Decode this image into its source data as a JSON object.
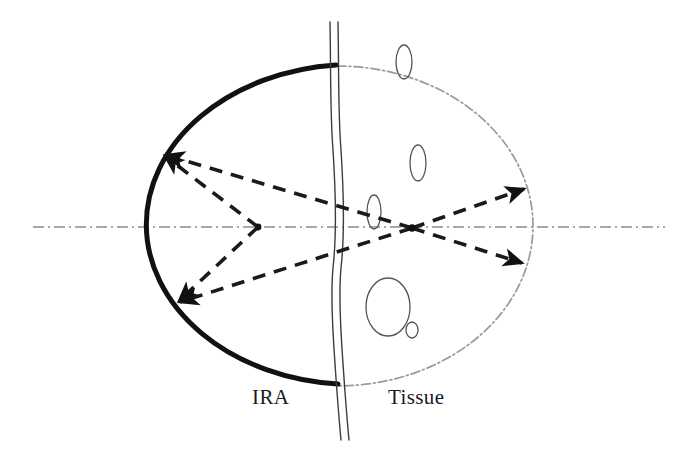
{
  "figure": {
    "kind": "schematic-diagram",
    "background_color": "#ffffff",
    "canvas": {
      "width": 687,
      "height": 453
    }
  },
  "labels": [
    {
      "id": "ira",
      "text": "IRA",
      "x": 252,
      "y": 385,
      "color": "#1a1a1a",
      "font_size": 21
    },
    {
      "id": "tissue",
      "text": "Tissue",
      "x": 388,
      "y": 385,
      "color": "#1a1a1a",
      "font_size": 21
    }
  ],
  "colors": {
    "solid_arc": "#111111",
    "dashed_ray": "#1a1a1a",
    "dotted_arc": "#9a9a9a",
    "axis": "#8c8c8c",
    "boundary": "#3d3d3d",
    "ellipse_outline": "#555555"
  },
  "geometry": {
    "axis": {
      "name": "optical-axis",
      "style": "dash-dot",
      "x_start": 33,
      "x_end": 665,
      "y": 227
    },
    "solid_arc": {
      "name": "ira-reflector-arc",
      "description": "Thick solid left half of the ellipse representing the IRA reflector",
      "center_x": 337,
      "center_y": 226,
      "rx": 207,
      "ry": 160,
      "stroke_width": 5
    },
    "dotted_arc": {
      "name": "tissue-boundary-arc",
      "description": "Light dash-dot right half of the ellipse inside tissue",
      "center_x": 337,
      "center_y": 226,
      "rx": 196,
      "ry": 160,
      "stroke_width": 1.6
    },
    "boundary": {
      "name": "ira-tissue-interface",
      "description": "Hand drawn wavy vertical double line separating IRA from tissue",
      "x_top": 330,
      "y_top": 22,
      "x_bottom": 344,
      "y_bottom": 440,
      "gap": 7
    },
    "focus_left": {
      "x": 258,
      "y": 227
    },
    "focus_right": {
      "x": 412,
      "y": 228
    },
    "vertex_upper_left": {
      "x": 162,
      "y": 154
    },
    "vertex_lower_left": {
      "x": 176,
      "y": 303
    },
    "vertex_upper_right": {
      "x": 527,
      "y": 187
    },
    "vertex_lower_right": {
      "x": 525,
      "y": 265
    }
  },
  "rays": [
    {
      "id": "ray-1",
      "name": "ray-focus-left-to-upper-left",
      "from": [
        258,
        227
      ],
      "to": [
        162,
        154
      ],
      "arrow_at": "to"
    },
    {
      "id": "ray-2",
      "name": "ray-focus-left-to-lower-left",
      "from": [
        258,
        227
      ],
      "to": [
        176,
        303
      ],
      "arrow_at": "to"
    },
    {
      "id": "ray-3",
      "name": "ray-focus-right-to-upper-left",
      "from": [
        412,
        228
      ],
      "to": [
        162,
        154
      ],
      "arrow_at": "to"
    },
    {
      "id": "ray-4",
      "name": "ray-focus-right-to-lower-left",
      "from": [
        412,
        228
      ],
      "to": [
        176,
        303
      ],
      "arrow_at": "to"
    },
    {
      "id": "ray-5",
      "name": "ray-focus-right-to-upper-right",
      "from": [
        412,
        228
      ],
      "to": [
        527,
        187
      ],
      "arrow_at": "to"
    },
    {
      "id": "ray-6",
      "name": "ray-focus-right-to-lower-right",
      "from": [
        412,
        228
      ],
      "to": [
        525,
        265
      ],
      "arrow_at": "to"
    }
  ],
  "tissue_inclusions": [
    {
      "id": "inclusion-1",
      "cx": 404,
      "cy": 62,
      "rx": 8,
      "ry": 17,
      "rotation": 0
    },
    {
      "id": "inclusion-2",
      "cx": 418,
      "cy": 163,
      "rx": 8,
      "ry": 18,
      "rotation": 0
    },
    {
      "id": "inclusion-3",
      "cx": 374,
      "cy": 212,
      "rx": 7,
      "ry": 17,
      "rotation": 0
    },
    {
      "id": "inclusion-4",
      "cx": 388,
      "cy": 307,
      "rx": 22,
      "ry": 29,
      "rotation": 0
    },
    {
      "id": "inclusion-5",
      "cx": 412,
      "cy": 330,
      "rx": 6,
      "ry": 8,
      "rotation": 0
    }
  ]
}
